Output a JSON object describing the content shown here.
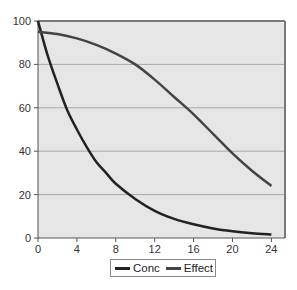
{
  "chart_data": {
    "type": "line",
    "title": "",
    "xlabel": "",
    "ylabel": "",
    "xlim": [
      0,
      25.4
    ],
    "ylim": [
      0,
      100
    ],
    "x_ticks": [
      0,
      4,
      8,
      12,
      16,
      20,
      24
    ],
    "y_ticks": [
      0,
      20,
      40,
      60,
      80,
      100
    ],
    "grid": true,
    "legend_position": "bottom-center",
    "series": [
      {
        "name": "Conc",
        "color": "#222222",
        "x": [
          0,
          1,
          2,
          3,
          4,
          5,
          6,
          7,
          8,
          10,
          12,
          14,
          16,
          18,
          20,
          22,
          24
        ],
        "values": [
          100,
          84,
          71,
          59,
          50,
          42,
          35,
          30,
          25,
          18,
          12.5,
          8.8,
          6.3,
          4.4,
          3.1,
          2.2,
          1.6
        ]
      },
      {
        "name": "Effect",
        "color": "#444444",
        "x": [
          0,
          2,
          4,
          6,
          8,
          10,
          12,
          14,
          16,
          18,
          20,
          22,
          24
        ],
        "values": [
          95,
          94,
          92,
          89,
          85,
          80,
          73,
          65,
          57,
          48,
          39,
          31,
          24
        ]
      }
    ]
  },
  "colors": {
    "plot_background": "#e6e6e6",
    "gridline": "#a8a8a8",
    "frame": "#7a7a7a"
  }
}
